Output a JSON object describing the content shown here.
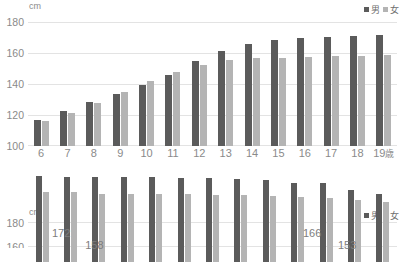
{
  "chart_data": [
    {
      "type": "bar",
      "title": "",
      "unit_label": "cm",
      "xlabel": "歳",
      "ylabel": "cm",
      "ylim": [
        100,
        180
      ],
      "yticks": [
        100,
        120,
        140,
        160,
        180
      ],
      "grid": true,
      "legend_position": "top-right",
      "categories": [
        "6",
        "7",
        "8",
        "9",
        "10",
        "11",
        "12",
        "13",
        "14",
        "15",
        "16",
        "17",
        "18",
        "19"
      ],
      "x_axis_suffix": "歳",
      "series": [
        {
          "name": "男",
          "color": "#5b5b5b",
          "values": [
            117,
            123,
            128.5,
            134,
            140,
            146.5,
            155,
            162,
            166.5,
            169,
            170.5,
            171,
            171.5,
            172.5
          ]
        },
        {
          "name": "女",
          "color": "#b4b4b4",
          "values": [
            116,
            121.5,
            128,
            135,
            142,
            148,
            153,
            156,
            157,
            157.5,
            158,
            158.5,
            158.5,
            159
          ]
        }
      ]
    },
    {
      "type": "bar",
      "title": "",
      "unit_label": "cm",
      "ylim": [
        100,
        180
      ],
      "yticks": [
        180,
        160
      ],
      "grid": true,
      "legend_position": "top-right",
      "categories": [
        "1",
        "2",
        "3",
        "4",
        "5",
        "6",
        "7",
        "8",
        "9",
        "10",
        "11",
        "12",
        "13"
      ],
      "series": [
        {
          "name": "男",
          "color": "#5b5b5b",
          "values": [
            172,
            171,
            171,
            171,
            171,
            170,
            170,
            169,
            168,
            166,
            166,
            160,
            157
          ]
        },
        {
          "name": "女",
          "color": "#b4b4b4",
          "values": [
            158,
            158,
            157,
            157,
            157,
            157,
            156,
            156,
            155,
            154,
            153,
            152,
            150
          ]
        }
      ],
      "data_labels": [
        {
          "text": "172",
          "x_pct": 6.5,
          "y_px": 6
        },
        {
          "text": "158",
          "x_pct": 15.5,
          "y_px": 18
        },
        {
          "text": "166",
          "x_pct": 74.5,
          "y_px": 6
        },
        {
          "text": "153",
          "x_pct": 84.0,
          "y_px": 18
        }
      ]
    }
  ],
  "chart1": {
    "unit_label": "cm",
    "yticks": [
      "180",
      "160",
      "140",
      "120",
      "100"
    ],
    "legend": [
      {
        "label": "男",
        "color": "#5b5b5b"
      },
      {
        "label": "女",
        "color": "#b4b4b4"
      }
    ],
    "xlabels": [
      "6",
      "7",
      "8",
      "9",
      "10",
      "11",
      "12",
      "13",
      "14",
      "15",
      "16",
      "17",
      "18",
      "19"
    ],
    "x_suffix": "歳"
  },
  "chart2": {
    "unit_label": "cm",
    "yticks": [
      "180",
      "160"
    ],
    "legend": [
      {
        "label": "男",
        "color": "#5b5b5b"
      },
      {
        "label": "女",
        "color": "#b4b4b4"
      }
    ]
  }
}
